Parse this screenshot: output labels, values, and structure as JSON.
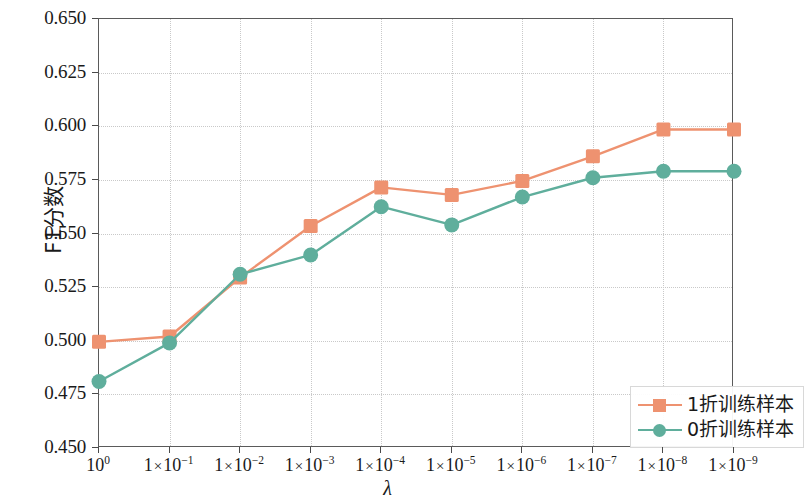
{
  "chart_data": {
    "type": "line",
    "title": "",
    "xlabel": "λ",
    "ylabel": "F1分数",
    "ylim": [
      0.45,
      0.65
    ],
    "grid": true,
    "legend_position": "lower right",
    "categories": [
      "10⁰",
      "1 × 10⁻¹",
      "1 × 10⁻²",
      "1 × 10⁻³",
      "1 × 10⁻⁴",
      "1 × 10⁻⁵",
      "1 × 10⁻⁶",
      "1 × 10⁻⁷",
      "1 × 10⁻⁸",
      "1 × 10⁻⁹"
    ],
    "ytick_labels": [
      "0.450",
      "0.475",
      "0.500",
      "0.525",
      "0.550",
      "0.575",
      "0.600",
      "0.625",
      "0.650"
    ],
    "ytick_values": [
      0.45,
      0.475,
      0.5,
      0.525,
      0.55,
      0.575,
      0.6,
      0.625,
      0.65
    ],
    "series": [
      {
        "name": "1折训练样本",
        "color": "#EE9270",
        "marker": "square",
        "values": [
          0.4995,
          0.502,
          0.5295,
          0.5535,
          0.5715,
          0.568,
          0.5745,
          0.586,
          0.5985,
          0.5985
        ]
      },
      {
        "name": "0折训练样本",
        "color": "#5FAE9C",
        "marker": "circle",
        "values": [
          0.481,
          0.499,
          0.531,
          0.54,
          0.5625,
          0.554,
          0.567,
          0.576,
          0.579,
          0.579
        ]
      }
    ]
  },
  "xaxis": {
    "tick_labels": [
      {
        "mantissa": "10",
        "exponent": "0",
        "plain": true
      },
      {
        "mantissa": "1",
        "exponent": "-1",
        "plain": false
      },
      {
        "mantissa": "1",
        "exponent": "-2",
        "plain": false
      },
      {
        "mantissa": "1",
        "exponent": "-3",
        "plain": false
      },
      {
        "mantissa": "1",
        "exponent": "-4",
        "plain": false
      },
      {
        "mantissa": "1",
        "exponent": "-5",
        "plain": false
      },
      {
        "mantissa": "1",
        "exponent": "-6",
        "plain": false
      },
      {
        "mantissa": "1",
        "exponent": "-7",
        "plain": false
      },
      {
        "mantissa": "1",
        "exponent": "-8",
        "plain": false
      },
      {
        "mantissa": "1",
        "exponent": "-9",
        "plain": false
      }
    ],
    "title": "λ"
  },
  "yaxis": {
    "title": "F1分数",
    "tick_labels": [
      "0.650",
      "0.625",
      "0.600",
      "0.575",
      "0.550",
      "0.525",
      "0.500",
      "0.475",
      "0.450"
    ]
  },
  "legend": {
    "items": [
      {
        "label": "1折训练样本",
        "color": "#EE9270",
        "marker": "square"
      },
      {
        "label": "0折训练样本",
        "color": "#5FAE9C",
        "marker": "circle"
      }
    ]
  },
  "style": {
    "axis_color": "#5a5a5a",
    "grid_color": "#c9c9c9",
    "background": "#ffffff",
    "series_orange": "#EE9270",
    "series_green": "#5FAE9C"
  }
}
